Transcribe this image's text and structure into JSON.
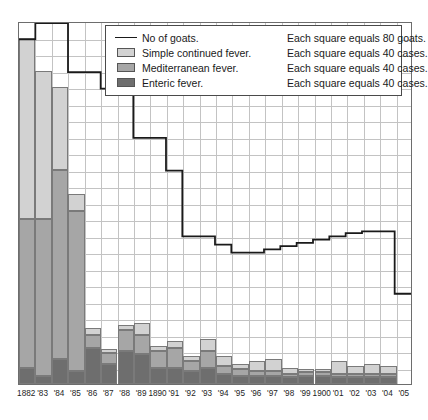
{
  "legend": {
    "rows": [
      {
        "icon": "line-swatch",
        "label": "No of goats.",
        "note": "Each square equals 80 goats."
      },
      {
        "icon": "square-swatch",
        "label": "Simple continued fever.",
        "note": "Each square equals 40 cases."
      },
      {
        "icon": "square-swatch",
        "label": "Mediterranean fever.",
        "note": "Each square equals 40 cases."
      },
      {
        "icon": "square-swatch",
        "label": "Enteric fever.",
        "note": "Each square equals 40 cases."
      }
    ]
  },
  "colors": {
    "simple": "#d2d2d2",
    "mediterranean": "#a6a6a6",
    "enteric": "#6e6e6e",
    "goats_line": "#1a1a1a",
    "grid": "#c3c3c3",
    "frame": "#6d6d6d"
  },
  "chart_data": {
    "type": "bar",
    "title": "",
    "xlabel": "",
    "ylabel": "",
    "grid": true,
    "legend_position": "top-right-inside",
    "stacked": true,
    "unit_cases_per_square": 40,
    "unit_goats_per_square": 80,
    "squares_y": 22,
    "ylim": [
      0,
      880
    ],
    "categories": [
      "1882",
      "'83",
      "'84",
      "'85",
      "'86",
      "'87",
      "'88",
      "'89",
      "1890",
      "'91",
      "'92",
      "'93",
      "'94",
      "'95",
      "'96",
      "'97",
      "'98",
      "'99",
      "1900",
      "'01",
      "'02",
      "'03",
      "'04",
      "'05"
    ],
    "series": [
      {
        "name": "Enteric fever.",
        "color": "#6e6e6e",
        "unit": "cases",
        "squares": [
          1.0,
          0.5,
          1.5,
          0.8,
          2.2,
          1.2,
          2.0,
          1.8,
          1.0,
          1.0,
          0.8,
          1.0,
          0.6,
          0.5,
          0.5,
          0.5,
          0.4,
          0.5,
          0.5,
          0.4,
          0.4,
          0.4,
          0.4,
          0.0
        ],
        "values": [
          40,
          20,
          60,
          32,
          88,
          48,
          80,
          72,
          40,
          40,
          32,
          40,
          24,
          20,
          20,
          20,
          16,
          20,
          20,
          16,
          16,
          16,
          16,
          0
        ]
      },
      {
        "name": "Mediterranean fever.",
        "color": "#a6a6a6",
        "unit": "cases",
        "squares": [
          9.0,
          9.5,
          11.5,
          9.7,
          0.8,
          0.7,
          1.3,
          1.2,
          1.0,
          1.2,
          0.6,
          1.0,
          0.5,
          0.4,
          0.3,
          0.3,
          0.2,
          0.2,
          0.2,
          0.2,
          0.2,
          0.2,
          0.2,
          0.0
        ],
        "values": [
          360,
          380,
          460,
          388,
          32,
          28,
          52,
          48,
          40,
          48,
          24,
          40,
          20,
          16,
          12,
          12,
          8,
          8,
          8,
          8,
          8,
          8,
          8,
          0
        ]
      },
      {
        "name": "Simple continued fever.",
        "color": "#d2d2d2",
        "unit": "cases",
        "squares": [
          11.0,
          9.0,
          5.0,
          1.0,
          0.4,
          0.2,
          0.3,
          0.7,
          0.3,
          0.4,
          0.3,
          0.7,
          0.6,
          0.3,
          0.6,
          0.7,
          0.4,
          0.2,
          0.2,
          0.8,
          0.5,
          0.6,
          0.5,
          0.0
        ],
        "values": [
          440,
          360,
          200,
          40,
          16,
          8,
          12,
          28,
          12,
          16,
          12,
          28,
          24,
          12,
          24,
          28,
          16,
          8,
          8,
          32,
          20,
          24,
          20,
          0
        ]
      }
    ],
    "goats_line": {
      "name": "No of goats.",
      "unit": "goats",
      "color": "#1a1a1a",
      "squares": [
        21.0,
        22.0,
        22.0,
        19.0,
        19.0,
        18.0,
        18.0,
        15.0,
        15.0,
        13.0,
        9.0,
        9.0,
        8.5,
        8.0,
        8.0,
        8.2,
        8.4,
        8.6,
        8.8,
        9.0,
        9.2,
        9.3,
        9.3,
        5.5
      ],
      "values": [
        1680,
        1760,
        1760,
        1520,
        1520,
        1440,
        1440,
        1200,
        1200,
        1040,
        720,
        720,
        680,
        640,
        640,
        656,
        672,
        688,
        704,
        720,
        736,
        744,
        744,
        440
      ]
    }
  },
  "xaxis": {
    "ticks": [
      "1882",
      "'83",
      "'84",
      "'85",
      "'86",
      "'87",
      "'88",
      "'89",
      "1890",
      "'91",
      "'92",
      "'93",
      "'94",
      "'95",
      "'96",
      "'97",
      "'98",
      "'99",
      "1900",
      "'01",
      "'02",
      "'03",
      "'04",
      "'05"
    ]
  }
}
